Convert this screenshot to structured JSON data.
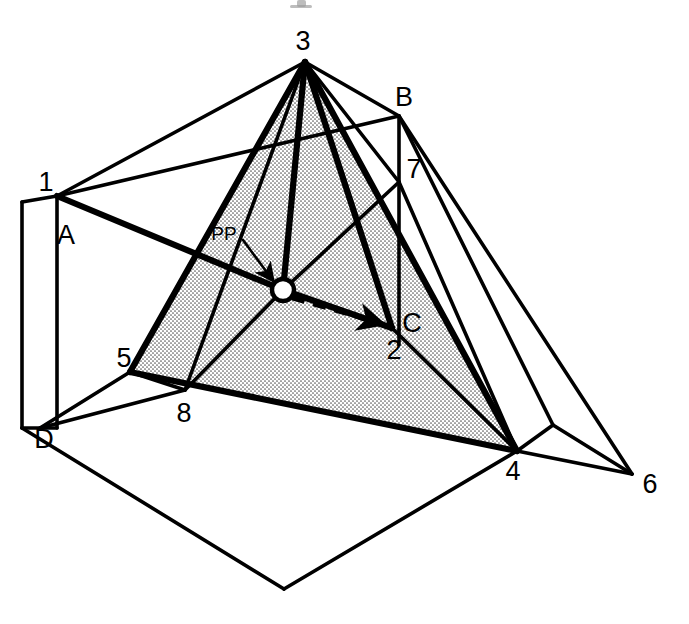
{
  "figure": {
    "background_color": "#ffffff",
    "ink_color": "#000000",
    "shade_color": "#c9c9c9",
    "width": 689,
    "height": 624
  },
  "labels": {
    "numeric": [
      {
        "id": "n1",
        "text": "1",
        "x": 46,
        "y": 184
      },
      {
        "id": "n2",
        "text": "2",
        "x": 394,
        "y": 352
      },
      {
        "id": "n3",
        "text": "3",
        "x": 303,
        "y": 43
      },
      {
        "id": "n4",
        "text": "4",
        "x": 513,
        "y": 473
      },
      {
        "id": "n5",
        "text": "5",
        "x": 124,
        "y": 360
      },
      {
        "id": "n6",
        "text": "6",
        "x": 650,
        "y": 486
      },
      {
        "id": "n7",
        "text": "7",
        "x": 414,
        "y": 171
      },
      {
        "id": "n8",
        "text": "8",
        "x": 184,
        "y": 415
      }
    ],
    "alpha": [
      {
        "id": "lA",
        "text": "A",
        "x": 66,
        "y": 237
      },
      {
        "id": "lB",
        "text": "B",
        "x": 404,
        "y": 99
      },
      {
        "id": "lC",
        "text": "C",
        "x": 412,
        "y": 325
      },
      {
        "id": "lD",
        "text": "D",
        "x": 44,
        "y": 441
      }
    ],
    "annotation": {
      "id": "pp",
      "text": "PP",
      "x": 224,
      "y": 235
    }
  },
  "points": {
    "p1": {
      "x": 57,
      "y": 196
    },
    "p2": {
      "x": 392,
      "y": 328
    },
    "p3": {
      "x": 305,
      "y": 62
    },
    "p4": {
      "x": 517,
      "y": 451
    },
    "p5": {
      "x": 130,
      "y": 372
    },
    "p6": {
      "x": 632,
      "y": 474
    },
    "p7": {
      "x": 399,
      "y": 182
    },
    "p8": {
      "x": 185,
      "y": 390
    },
    "A": {
      "x": 57,
      "y": 196
    },
    "B": {
      "x": 399,
      "y": 116
    },
    "C": {
      "x": 392,
      "y": 328
    },
    "D": {
      "x": 40,
      "y": 428
    },
    "PP": {
      "x": 283,
      "y": 290
    },
    "hex_left": {
      "x": 22,
      "y": 428
    },
    "hex_bottom": {
      "x": 284,
      "y": 589
    },
    "hex_right": {
      "x": 553,
      "y": 425
    },
    "hex_topleft": {
      "x": 22,
      "y": 202
    }
  },
  "elements": {
    "pp_marker": {
      "name": "projection-point-circle",
      "radius": 11
    },
    "pp_arrow": {
      "name": "pp-leader-arrow",
      "from_x": 248,
      "from_y": 240,
      "to_x": 276,
      "to_y": 283
    },
    "sight_ray": {
      "name": "dashed-sight-line",
      "from_x": 290,
      "from_y": 297,
      "to_x": 388,
      "to_y": 326
    },
    "shaded_face": {
      "name": "picture-plane-triangle",
      "vertices": [
        "p3",
        "p5",
        "p4"
      ]
    }
  },
  "geometry": {
    "shaded_polygon": "305,62 130,372 517,451",
    "outer_hull": "22,202 57,196 305,62 399,116 553,425 517,451 284,589 22,428",
    "edges_thick": [
      "305,62 130,372",
      "305,62 517,451",
      "130,372 517,451",
      "57,196 283,290",
      "283,290 392,328",
      "305,62 392,328",
      "305,62 283,290"
    ],
    "edges_medium": [
      "57,196 305,62",
      "305,62 399,116",
      "399,116 553,425",
      "553,425 632,474",
      "517,451 632,474",
      "399,116 632,474",
      "57,196 399,116",
      "22,202 22,428",
      "57,196 57,428",
      "22,202 57,196",
      "22,428 57,428",
      "22,428 284,589",
      "284,589 517,451",
      "40,428 130,372",
      "40,428 185,390",
      "130,372 185,390",
      "185,390 305,62",
      "283,290 185,390",
      "392,328 517,451",
      "399,182 399,328",
      "399,116 399,182",
      "283,290 399,182",
      "305,62 399,182",
      "553,425 517,451",
      "399,182 517,451"
    ]
  }
}
